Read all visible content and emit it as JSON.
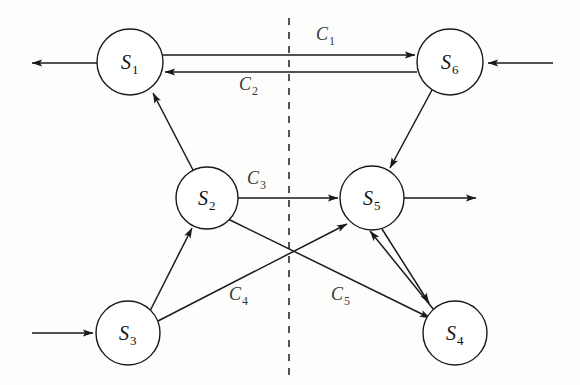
{
  "diagram": {
    "background_color": "#fdfdfc",
    "stroke_color": "#1a1a1a",
    "label_color": "#3a3a3a",
    "divider": {
      "name": "vertical-dashed-divider",
      "x": 289,
      "y1": 18,
      "y2": 380,
      "style": "dashed"
    },
    "nodes": [
      {
        "id": "S1",
        "base": "S",
        "sub": "1",
        "cx": 130,
        "cy": 62,
        "r": 33
      },
      {
        "id": "S2",
        "base": "S",
        "sub": "2",
        "cx": 207,
        "cy": 198,
        "r": 31
      },
      {
        "id": "S3",
        "base": "S",
        "sub": "3",
        "cx": 128,
        "cy": 333,
        "r": 32
      },
      {
        "id": "S4",
        "base": "S",
        "sub": "4",
        "cx": 455,
        "cy": 333,
        "r": 32
      },
      {
        "id": "S5",
        "base": "S",
        "sub": "5",
        "cx": 372,
        "cy": 198,
        "r": 32
      },
      {
        "id": "S6",
        "base": "S",
        "sub": "6",
        "cx": 450,
        "cy": 62,
        "r": 33
      }
    ],
    "edge_labels": [
      {
        "id": "C1",
        "base": "C",
        "sub": "1",
        "x": 325,
        "y": 40,
        "from": "S1",
        "to": "S6"
      },
      {
        "id": "C2",
        "base": "C",
        "sub": "2",
        "x": 248,
        "y": 90,
        "from": "S6",
        "to": "S1"
      },
      {
        "id": "C3",
        "base": "C",
        "sub": "3",
        "x": 255,
        "y": 184,
        "from": "S2",
        "to": "S5"
      },
      {
        "id": "C4",
        "base": "C",
        "sub": "4",
        "x": 237,
        "y": 300,
        "from": "S3",
        "to": "S5"
      },
      {
        "id": "C5",
        "base": "C",
        "sub": "5",
        "x": 339,
        "y": 300,
        "from": "S2",
        "to": "S4"
      }
    ],
    "edges": [
      {
        "name": "edge-s1-to-s6",
        "from": "S1",
        "to": "S6",
        "label": "C1",
        "arrow": "forward"
      },
      {
        "name": "edge-s6-to-s1",
        "from": "S6",
        "to": "S1",
        "label": "C2",
        "arrow": "forward"
      },
      {
        "name": "edge-s2-to-s1",
        "from": "S2",
        "to": "S1",
        "label": "",
        "arrow": "forward"
      },
      {
        "name": "edge-s6-to-s5",
        "from": "S6",
        "to": "S5",
        "label": "",
        "arrow": "forward"
      },
      {
        "name": "edge-s2-to-s5",
        "from": "S2",
        "to": "S5",
        "label": "C3",
        "arrow": "forward"
      },
      {
        "name": "edge-s3-to-s2",
        "from": "S3",
        "to": "S2",
        "label": "",
        "arrow": "forward"
      },
      {
        "name": "edge-s3-to-s5",
        "from": "S3",
        "to": "S5",
        "label": "C4",
        "arrow": "forward"
      },
      {
        "name": "edge-s2-to-s4",
        "from": "S2",
        "to": "S4",
        "label": "C5",
        "arrow": "forward"
      },
      {
        "name": "edge-s5-to-s4",
        "from": "S5",
        "to": "S4",
        "label": "",
        "arrow": "forward"
      },
      {
        "name": "edge-s4-to-s5",
        "from": "S4",
        "to": "S5",
        "label": "",
        "arrow": "forward"
      }
    ],
    "external_arrows": [
      {
        "name": "output-arrow-s1-left",
        "x1": 97,
        "y1": 63,
        "x2": 30,
        "y2": 63,
        "direction": "out"
      },
      {
        "name": "input-arrow-s6-right",
        "x1": 553,
        "y1": 63,
        "x2": 486,
        "y2": 63,
        "direction": "in"
      },
      {
        "name": "output-arrow-s5-right",
        "x1": 404,
        "y1": 198,
        "x2": 478,
        "y2": 198,
        "direction": "out"
      },
      {
        "name": "input-arrow-s3-left",
        "x1": 32,
        "y1": 333,
        "x2": 95,
        "y2": 333,
        "direction": "in"
      }
    ]
  }
}
